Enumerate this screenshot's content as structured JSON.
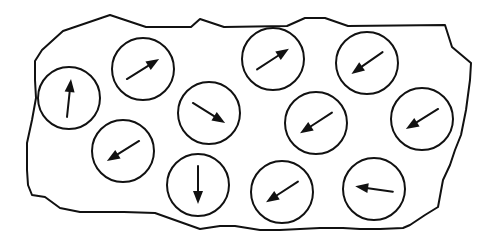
{
  "diagram": {
    "title": "",
    "colors": {
      "stroke": "#111111",
      "background": "#ffffff"
    },
    "domains": [
      {
        "id": "d1",
        "direction_deg": 84
      },
      {
        "id": "d2",
        "direction_deg": 32
      },
      {
        "id": "d3",
        "direction_deg": -32
      },
      {
        "id": "d4",
        "direction_deg": 212
      },
      {
        "id": "d5",
        "direction_deg": 270
      },
      {
        "id": "d6",
        "direction_deg": 33
      },
      {
        "id": "d7",
        "direction_deg": 215
      },
      {
        "id": "d8",
        "direction_deg": 213
      },
      {
        "id": "d9",
        "direction_deg": 212
      },
      {
        "id": "d10",
        "direction_deg": 213
      },
      {
        "id": "d11",
        "direction_deg": 172
      }
    ]
  }
}
